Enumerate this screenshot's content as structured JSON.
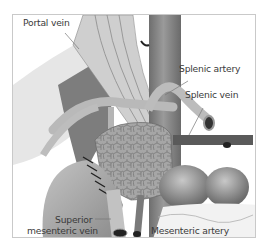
{
  "diagram": {
    "type": "anatomical-illustration",
    "labels": {
      "portal_vein": "Portal vein",
      "splenic_artery": "Splenic artery",
      "splenic_vein": "Splenic vein",
      "superior_mesenteric_vein_line1": "Superior",
      "superior_mesenteric_vein_line2": "mesenteric vein",
      "mesenteric_artery": "Mesenteric artery"
    },
    "colors": {
      "vessel_light": "#bdbdbd",
      "vessel_mid": "#8e8e8e",
      "vessel_dark": "#5f5f5f",
      "pancreas": "#a8a8a8",
      "frame_border": "#c9c9c9",
      "label_text": "#3a3a3a"
    }
  }
}
